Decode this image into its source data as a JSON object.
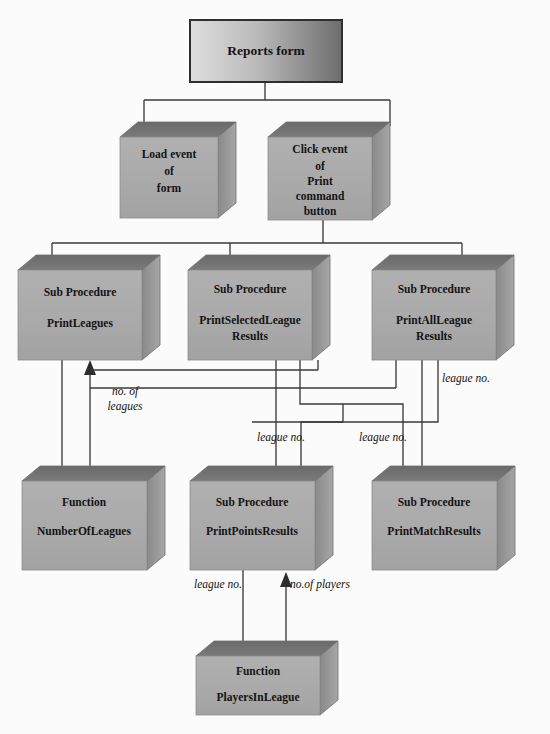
{
  "diagram": {
    "type": "structure-chart",
    "title_box": {
      "id": "reports-form",
      "lines": [
        "Reports form"
      ]
    },
    "nodes": [
      {
        "id": "reports-form",
        "kind": "form",
        "lines": [
          "Reports form"
        ],
        "shape": "flat-rect"
      },
      {
        "id": "load-event-form",
        "kind": "event",
        "lines": [
          "Load event",
          "of",
          "form"
        ],
        "shape": "cube"
      },
      {
        "id": "click-event-print",
        "kind": "event",
        "lines": [
          "Click  event",
          "of",
          "Print",
          "command",
          "button"
        ],
        "shape": "cube"
      },
      {
        "id": "sub-print-leagues",
        "kind": "Sub Procedure",
        "lines": [
          "Sub Procedure",
          "PrintLeagues"
        ],
        "shape": "cube"
      },
      {
        "id": "sub-print-selected-league-results",
        "kind": "Sub Procedure",
        "lines": [
          "Sub Procedure",
          "PrintSelectedLeague",
          "Results"
        ],
        "shape": "cube"
      },
      {
        "id": "sub-print-all-league-results",
        "kind": "Sub Procedure",
        "lines": [
          "Sub Procedure",
          "PrintAllLeague",
          "Results"
        ],
        "shape": "cube"
      },
      {
        "id": "func-number-of-leagues",
        "kind": "Function",
        "lines": [
          "Function",
          "NumberOfLeagues"
        ],
        "shape": "cube"
      },
      {
        "id": "sub-print-points-results",
        "kind": "Sub Procedure",
        "lines": [
          "Sub Procedure",
          "PrintPointsResults"
        ],
        "shape": "cube"
      },
      {
        "id": "sub-print-match-results",
        "kind": "Sub Procedure",
        "lines": [
          "Sub Procedure",
          "PrintMatchResults"
        ],
        "shape": "cube"
      },
      {
        "id": "func-players-in-league",
        "kind": "Function",
        "lines": [
          "Function",
          "PlayersInLeague"
        ],
        "shape": "cube"
      }
    ],
    "edge_labels": [
      {
        "id": "no-of-leagues",
        "text_lines": [
          "no. of",
          "leagues"
        ]
      },
      {
        "id": "league-no-right",
        "text_lines": [
          "league no."
        ]
      },
      {
        "id": "league-no-points-a",
        "text_lines": [
          "league no."
        ]
      },
      {
        "id": "league-no-points-b",
        "text_lines": [
          "league no."
        ]
      },
      {
        "id": "league-no-players",
        "text_lines": [
          "league no."
        ]
      },
      {
        "id": "no-of-players",
        "text_lines": [
          "no.of players"
        ]
      }
    ],
    "colors": {
      "front_face": "#a9a9a9",
      "top_face": "#6f6f6f",
      "side_face": "#8f8f8f",
      "outline": "#6a6a6a",
      "connector": "#3a3a3a",
      "text": "#141414",
      "background": "#fbfbfb",
      "title_fill_light": "#d9d9d9",
      "title_fill_dark": "#6e6e6e"
    }
  },
  "labels": {
    "n0_l0": "Reports form",
    "n1_l0": "Load event",
    "n1_l1": "of",
    "n1_l2": "form",
    "n2_l0": "Click  event",
    "n2_l1": "of",
    "n2_l2": "Print",
    "n2_l3": "command",
    "n2_l4": "button",
    "n3_l0": "Sub Procedure",
    "n3_l1": "PrintLeagues",
    "n4_l0": "Sub Procedure",
    "n4_l1": "PrintSelectedLeague",
    "n4_l2": "Results",
    "n5_l0": "Sub Procedure",
    "n5_l1": "PrintAllLeague",
    "n5_l2": "Results",
    "n6_l0": "Function",
    "n6_l1": "NumberOfLeagues",
    "n7_l0": "Sub Procedure",
    "n7_l1": "PrintPointsResults",
    "n8_l0": "Sub Procedure",
    "n8_l1": "PrintMatchResults",
    "n9_l0": "Function",
    "n9_l1": "PlayersInLeague",
    "e0_l0": "no. of",
    "e0_l1": "leagues",
    "e1_l0": "league no.",
    "e2_l0": "league no.",
    "e3_l0": "league no.",
    "e4_l0": "league no.",
    "e5_l0": "no.of players"
  }
}
